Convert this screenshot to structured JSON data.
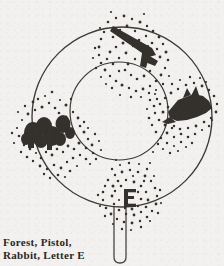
{
  "figure": {
    "background_color": "#f2f1ef",
    "ink_color": "#3a3632",
    "outer_circle": {
      "cx": 122,
      "cy": 117,
      "r": 90,
      "stroke_width": 1.3
    },
    "inner_circle": {
      "cx": 119,
      "cy": 111,
      "r": 49,
      "stroke_width": 1.2
    },
    "handle": {
      "x": 114,
      "y": 207,
      "width": 12,
      "height": 56,
      "stroke_width": 1.2
    },
    "objects": [
      {
        "name": "forest",
        "label": "Forest",
        "position": "left",
        "cx": 56,
        "cy": 128
      },
      {
        "name": "pistol",
        "label": "Pistol",
        "position": "top",
        "cx": 133,
        "cy": 45
      },
      {
        "name": "rabbit",
        "label": "Rabbit",
        "position": "right",
        "cx": 186,
        "cy": 113
      },
      {
        "name": "letter-e",
        "label": "Letter E",
        "position": "bottom",
        "cx": 131,
        "cy": 196
      }
    ]
  },
  "caption": {
    "line1": "Forest, Pistol,",
    "line2": "Rabbit, Letter E",
    "full": "Forest, Pistol, Rabbit, Letter E"
  }
}
